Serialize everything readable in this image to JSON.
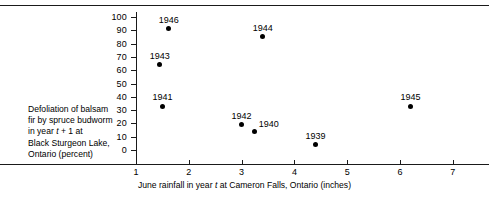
{
  "chart_data": {
    "type": "scatter",
    "title": "",
    "xlabel": "June rainfall in year t at Cameron Falls, Ontario (inches)",
    "ylabel": "Defoliation of balsam fir by spruce budworm in year t + 1 at Black Sturgeon Lake, Ontario (percent)",
    "xlim": [
      0.35,
      7.5
    ],
    "ylim": [
      0,
      100
    ],
    "xticks": [
      1,
      2,
      3,
      4,
      5,
      6,
      7
    ],
    "yticks": [
      0,
      10,
      20,
      30,
      40,
      50,
      60,
      70,
      80,
      90,
      100
    ],
    "grid": false,
    "legend": "none",
    "point_color": "#000000",
    "points": [
      {
        "label": "1939",
        "x": 4.4,
        "y": 4,
        "label_pos": "above"
      },
      {
        "label": "1940",
        "x": 3.25,
        "y": 14,
        "label_pos": "right"
      },
      {
        "label": "1941",
        "x": 1.5,
        "y": 33,
        "label_pos": "above"
      },
      {
        "label": "1942",
        "x": 3.0,
        "y": 19,
        "label_pos": "above"
      },
      {
        "label": "1943",
        "x": 1.45,
        "y": 64,
        "label_pos": "above"
      },
      {
        "label": "1944",
        "x": 3.4,
        "y": 85,
        "label_pos": "above"
      },
      {
        "label": "1945",
        "x": 6.2,
        "y": 33,
        "label_pos": "above"
      },
      {
        "label": "1946",
        "x": 1.62,
        "y": 91,
        "label_pos": "above"
      }
    ]
  },
  "axes": {
    "y_title_lines": [
      "Defoliation of balsam",
      "fir by spruce budworm",
      "in year ",
      "Black Sturgeon Lake,",
      "Ontario (percent)"
    ],
    "y_title_line3_italic": "t",
    "y_title_line3_rest": " + 1 at",
    "x_title_pre": "June rainfall in year ",
    "x_title_italic": "t",
    "x_title_post": " at Cameron Falls, Ontario (inches)",
    "ytick_labels": [
      "100",
      "90",
      "80",
      "70",
      "60",
      "50",
      "40",
      "30",
      "20",
      "10",
      "0"
    ],
    "xtick_labels": [
      "1",
      "2",
      "3",
      "4",
      "5",
      "6",
      "7"
    ]
  }
}
